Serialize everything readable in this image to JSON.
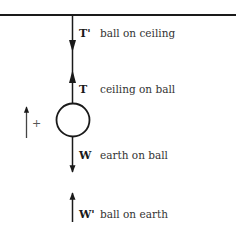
{
  "diagram": {
    "sign_convention": {
      "direction": "up",
      "label": "+"
    },
    "forces": [
      {
        "symbol": "T'",
        "description": "ball on ceiling",
        "direction": "down"
      },
      {
        "symbol": "T",
        "description": "ceiling on ball",
        "direction": "up"
      },
      {
        "symbol": "W",
        "description": "earth on ball",
        "direction": "down"
      },
      {
        "symbol": "W'",
        "description": "ball on earth",
        "direction": "up"
      }
    ],
    "colors": {
      "ink": "#1a1a1a",
      "text": "#333333"
    }
  }
}
